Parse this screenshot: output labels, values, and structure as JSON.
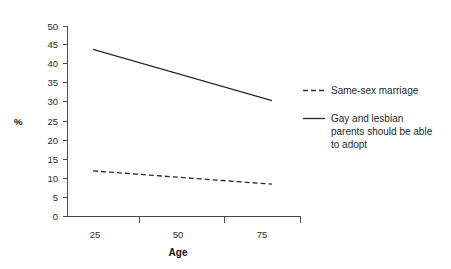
{
  "chart_data": {
    "type": "line",
    "title": "",
    "xlabel": "Age",
    "ylabel": "%",
    "x": [
      25,
      75
    ],
    "xlim": [
      25,
      75
    ],
    "ylim": [
      0,
      50
    ],
    "xticks": [
      25,
      50,
      75
    ],
    "yticks": [
      0,
      5,
      10,
      15,
      20,
      25,
      30,
      35,
      40,
      45,
      50
    ],
    "grid": false,
    "legend_position": "right",
    "series": [
      {
        "name": "Same-sex marriage",
        "style": "dashed",
        "values": [
          12,
          8.5
        ],
        "color": "#2a2a2a"
      },
      {
        "name": "Gay and lesbian parents should be able to adopt",
        "name_lines": [
          "Gay and lesbian",
          "parents should be able",
          "to adopt"
        ],
        "style": "solid",
        "values": [
          44,
          30.5
        ],
        "color": "#2a2a2a"
      }
    ]
  },
  "axes": {
    "y_title": "%",
    "x_title": "Age",
    "y_tick_labels": [
      "50",
      "45",
      "40",
      "35",
      "30",
      "25",
      "20",
      "15",
      "10",
      "5",
      "0"
    ],
    "x_tick_labels": [
      "25",
      "50",
      "75"
    ]
  },
  "legend": {
    "entries": [
      {
        "marker": "dashed-line-swatch",
        "label": "Same-sex marriage",
        "lines": [
          "Same-sex marriage"
        ]
      },
      {
        "marker": "solid-line-swatch",
        "label": "Gay and lesbian parents should be able to adopt",
        "lines": [
          "Gay and lesbian",
          "parents should be able",
          "to adopt"
        ]
      }
    ]
  }
}
